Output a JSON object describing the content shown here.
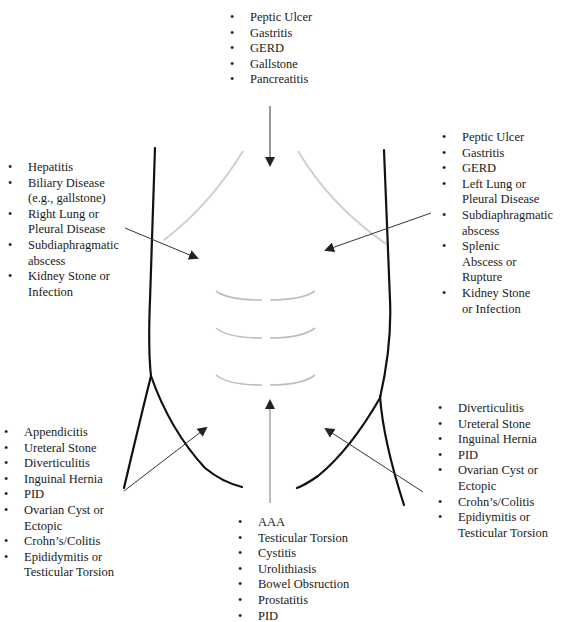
{
  "diagram": {
    "colors": {
      "outline": "#111111",
      "ribs": "#c8c8c8",
      "arrow": "#222222",
      "text": "#1a1a1a"
    },
    "regions": {
      "epigastric": {
        "items": [
          [
            "Peptic Ulcer"
          ],
          [
            "Gastritis"
          ],
          [
            "GERD"
          ],
          [
            "Gallstone"
          ],
          [
            "Pancreatitis"
          ]
        ]
      },
      "right_upper_quadrant": {
        "items": [
          [
            "Hepatitis"
          ],
          [
            "Biliary Disease",
            "(e.g., gallstone)"
          ],
          [
            "Right Lung or",
            "Pleural Disease"
          ],
          [
            "Subdiaphragmatic",
            "abscess"
          ],
          [
            "Kidney Stone or",
            "Infection"
          ]
        ]
      },
      "left_upper_quadrant": {
        "items": [
          [
            "Peptic Ulcer"
          ],
          [
            "Gastritis"
          ],
          [
            "GERD"
          ],
          [
            "Left Lung or",
            "Pleural Disease"
          ],
          [
            "Subdiaphragmatic",
            "abscess"
          ],
          [
            "Splenic",
            "Abscess or",
            "Rupture"
          ],
          [
            "Kidney Stone",
            "or Infection"
          ]
        ]
      },
      "right_lower_quadrant": {
        "items": [
          [
            "Appendicitis"
          ],
          [
            "Ureteral Stone"
          ],
          [
            "Diverticulitis"
          ],
          [
            "Inguinal Hernia"
          ],
          [
            "PID"
          ],
          [
            "Ovarian Cyst or",
            "Ectopic"
          ],
          [
            "Crohn’s/Colitis"
          ],
          [
            "Epididymitis or",
            "Testicular Torsion"
          ]
        ]
      },
      "left_lower_quadrant": {
        "items": [
          [
            "Diverticulitis"
          ],
          [
            "Ureteral Stone"
          ],
          [
            "Inguinal Hernia"
          ],
          [
            "PID"
          ],
          [
            "Ovarian Cyst or",
            "Ectopic"
          ],
          [
            "Crohn’s/Colitis"
          ],
          [
            "Epidiymitis or",
            "Testicular Torsion"
          ]
        ]
      },
      "suprapubic": {
        "items": [
          [
            "AAA"
          ],
          [
            "Testicular Torsion"
          ],
          [
            "Cystitis"
          ],
          [
            "Urolithiasis"
          ],
          [
            "Bowel Obsruction"
          ],
          [
            "Prostatitis"
          ],
          [
            "PID"
          ]
        ]
      }
    }
  }
}
